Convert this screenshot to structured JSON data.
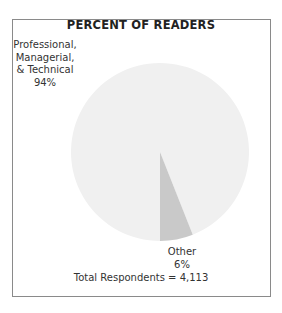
{
  "chart_data": {
    "type": "pie",
    "title": "PERCENT OF READERS",
    "categories": [
      "Professional, Managerial, & Technical",
      "Other"
    ],
    "values": [
      94,
      6
    ],
    "value_unit": "%",
    "colors": [
      "#f0f0f0",
      "#c9c9c9"
    ],
    "labels": [
      {
        "lines": [
          "Professional,",
          "Managerial,",
          "& Technical",
          "94%"
        ]
      },
      {
        "lines": [
          "Other",
          "6%"
        ]
      }
    ],
    "annotation": "Total Respondents = 4,113",
    "legend": "none"
  }
}
